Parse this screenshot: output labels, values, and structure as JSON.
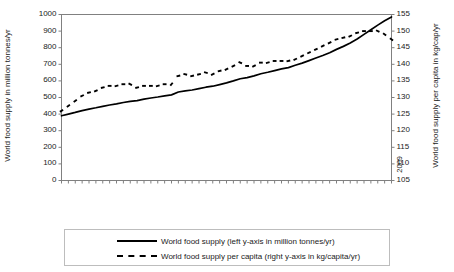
{
  "chart_data": {
    "type": "line",
    "title": "",
    "xlabel": "",
    "ylabel": "World food supply in million tonnes/yr",
    "y2label": "World food supply per capita in kg/cap/yr",
    "ylim": [
      0,
      1000
    ],
    "y2lim": [
      105,
      155
    ],
    "ytick_step": 100,
    "y2tick_step": 5,
    "grid": false,
    "legend_position": "bottom",
    "yticks": [
      0,
      100,
      200,
      300,
      400,
      500,
      600,
      700,
      800,
      900,
      1000
    ],
    "y2ticks": [
      105,
      110,
      115,
      120,
      125,
      130,
      135,
      140,
      145,
      150,
      155
    ],
    "x": [
      1961,
      1962,
      1963,
      1964,
      1965,
      1966,
      1967,
      1968,
      1969,
      1970,
      1971,
      1972,
      1973,
      1974,
      1975,
      1976,
      1977,
      1978,
      1979,
      1980,
      1981,
      1982,
      1983,
      1984,
      1985,
      1986,
      1987,
      1988,
      1989,
      1990,
      1991,
      1992,
      1993,
      1994,
      1995,
      1996,
      1997,
      1998,
      1999,
      2000,
      2001,
      2002,
      2003,
      2004,
      2005,
      2006,
      2007,
      2008,
      2009
    ],
    "xtick_labels": [
      "1961",
      "1963",
      "1965",
      "1967",
      "1969",
      "1971",
      "1973",
      "1975",
      "1977",
      "1979",
      "1981",
      "1983",
      "1985",
      "1987",
      "1989",
      "1991",
      "1993",
      "1995",
      "1997",
      "1999",
      "2001",
      "2003",
      "2005",
      "2007",
      "2009"
    ],
    "series": [
      {
        "name": "World food supply (left y-axis in million tonnes/yr)",
        "axis": "left",
        "style": "solid",
        "color": "#000000",
        "values": [
          390,
          400,
          410,
          421,
          430,
          438,
          447,
          455,
          462,
          470,
          477,
          481,
          490,
          497,
          503,
          510,
          516,
          533,
          540,
          545,
          553,
          562,
          568,
          578,
          588,
          600,
          613,
          620,
          630,
          643,
          652,
          662,
          672,
          680,
          694,
          707,
          722,
          738,
          753,
          770,
          790,
          808,
          828,
          852,
          880,
          908,
          936,
          962,
          985
        ]
      },
      {
        "name": "World food supply per capita (right y-axis in kg/capita/yr)",
        "axis": "right",
        "style": "dotted",
        "color": "#000000",
        "values": [
          126.0,
          127.5,
          129.0,
          130.5,
          131.5,
          132.0,
          133.0,
          133.5,
          133.5,
          134.0,
          134.0,
          133.0,
          133.5,
          133.5,
          133.5,
          134.0,
          134.0,
          136.5,
          137.0,
          136.5,
          137.0,
          137.5,
          137.0,
          138.0,
          138.5,
          139.5,
          140.5,
          139.5,
          139.5,
          140.5,
          140.5,
          141.0,
          141.0,
          141.0,
          141.5,
          142.5,
          143.5,
          144.5,
          145.5,
          146.5,
          147.5,
          148.0,
          148.5,
          149.5,
          150.0,
          150.0,
          150.0,
          149.0,
          147.5
        ]
      }
    ]
  },
  "legend": {
    "items": [
      {
        "label": "World food supply (left y-axis in million tonnes/yr)",
        "style": "solid"
      },
      {
        "label": "World food supply per capita (right y-axis in kg/capita/yr)",
        "style": "dotted"
      }
    ]
  },
  "axes": {
    "left_title": "World food supply in million tonnes/yr",
    "right_title": "World food supply per capita in kg/cap/yr"
  }
}
